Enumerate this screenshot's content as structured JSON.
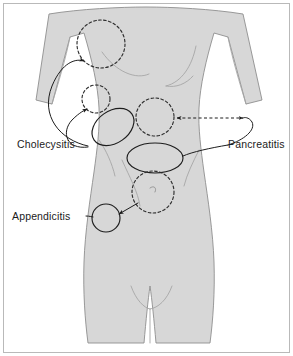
{
  "figure": {
    "type": "anatomical-diagram",
    "frame": {
      "border_color": "#b9b9b9",
      "background_color": "#ffffff",
      "width": 293,
      "height": 356
    },
    "body": {
      "fill_color": "#d7d7d7",
      "outline_color": "#8e8e8e",
      "view": "anterior",
      "subject": "female torso"
    }
  },
  "labels": [
    {
      "id": "cholecysitis",
      "text": "Cholecysitis",
      "position": "left",
      "x": 17,
      "y": 148,
      "targets": [
        "right-shoulder-tip-region",
        "right-subcostal-region"
      ],
      "pointer_style": "solid-curved-arrow",
      "arrow_count": 2
    },
    {
      "id": "pancreatitis",
      "text": "Pancreatitis",
      "position": "right",
      "x": 228,
      "y": 148,
      "targets": [
        "epigastric-region",
        "periumbilical-band-region"
      ],
      "pointer_style": "solid-line-with-dashed-double-arrow",
      "arrow_count": 2
    },
    {
      "id": "appendicitis",
      "text": "Appendicitis",
      "position": "left-lower",
      "x": 12,
      "y": 216,
      "targets": [
        "periumbilical-region",
        "right-iliac-fossa-region"
      ],
      "pointer_style": "solid-arrow",
      "arrow_count": 1
    }
  ],
  "regions": [
    {
      "id": "right-shoulder-tip-region",
      "shape": "circle",
      "style": "dashed",
      "cx": 101,
      "cy": 44,
      "r": 24,
      "label_ref": "cholecysitis",
      "description": "right shoulder tip / scapular referral"
    },
    {
      "id": "right-subcostal-region",
      "shape": "circle",
      "style": "dashed",
      "cx": 96,
      "cy": 99,
      "r": 14,
      "label_ref": "cholecysitis",
      "description": "right upper quadrant subcostal"
    },
    {
      "id": "gallbladder-ellipse",
      "shape": "ellipse",
      "style": "solid",
      "cx": 113,
      "cy": 127,
      "rx": 23,
      "ry": 16,
      "rotation": -35,
      "label_ref": "cholecysitis",
      "description": "gallbladder pain site"
    },
    {
      "id": "epigastric-region",
      "shape": "circle",
      "style": "dashed",
      "cx": 155,
      "cy": 117,
      "r": 19,
      "label_ref": "pancreatitis",
      "description": "epigastric referral"
    },
    {
      "id": "periumbilical-band-region",
      "shape": "ellipse",
      "style": "solid",
      "cx": 155,
      "cy": 158,
      "rx": 28,
      "ry": 15,
      "rotation": 0,
      "label_ref": "pancreatitis",
      "description": "pancreatic band pain site"
    },
    {
      "id": "periumbilical-region",
      "shape": "circle",
      "style": "dashed",
      "cx": 153,
      "cy": 192,
      "r": 21,
      "label_ref": "appendicitis",
      "description": "periumbilical early appendicitis"
    },
    {
      "id": "right-iliac-fossa-region",
      "shape": "circle",
      "style": "solid",
      "cx": 106,
      "cy": 218,
      "r": 14,
      "label_ref": "appendicitis",
      "description": "right iliac fossa / McBurney point"
    }
  ],
  "annotations": {
    "navel_marker": "umbilicus",
    "dashed_arrow_direction": "bidirectional"
  },
  "colors": {
    "body_fill": "#d7d7d7",
    "body_outline": "#8e8e8e",
    "marking_stroke": "#1d1d1d",
    "frame_border": "#b9b9b9",
    "text": "#1b1b1b"
  }
}
